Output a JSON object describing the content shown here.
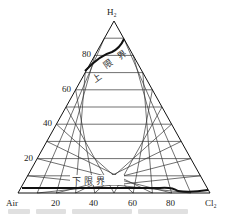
{
  "diagram": {
    "type": "ternary",
    "vertices": {
      "top": "H₂",
      "left": "Air",
      "right": "Cl₂"
    },
    "left_axis_ticks": [
      "20",
      "40",
      "60",
      "80"
    ],
    "bottom_axis_ticks": [
      "20",
      "40",
      "60",
      "80"
    ],
    "grid_divisions": 10,
    "upper_limit_label": [
      "上",
      "限",
      "界"
    ],
    "lower_limit_label": "下 限 界",
    "colors": {
      "line": "#111111",
      "grid": "#333333",
      "background": "#ffffff"
    }
  },
  "chart_data": {
    "type": "ternary",
    "title": "",
    "axes": {
      "top": "H2",
      "left": "Air",
      "right": "Cl2"
    },
    "ticks": [
      20,
      40,
      60,
      80
    ],
    "series": [
      {
        "name": "上限界 (upper limit)",
        "points_H2_pct": [
          [
            0,
            73
          ],
          [
            7,
            86
          ],
          [
            10,
            88
          ]
        ]
      },
      {
        "name": "下限界 (lower limit)",
        "points_H2_pct": [
          [
            0,
            4
          ],
          [
            60,
            4
          ],
          [
            78,
            4.5
          ],
          [
            85,
            3
          ],
          [
            100,
            3.5
          ]
        ]
      }
    ]
  }
}
